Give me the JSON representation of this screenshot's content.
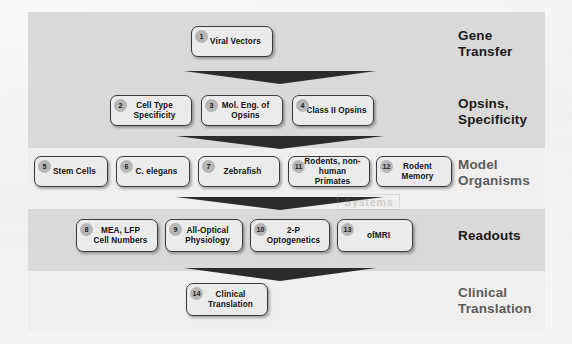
{
  "figure": {
    "watermark": "Systems",
    "colors": {
      "band_shaded": "#d9d9d9",
      "band_light": "#f0efed",
      "node_fill": "#ebebeb",
      "node_border": "#3a3a3a",
      "badge_fill": "#b6b6b6",
      "arrow": "#2b2b2b",
      "page": "#f7f7f5"
    }
  },
  "tiers": [
    {
      "id": "gene-transfer",
      "label": "Gene\nTransfer",
      "shaded": true,
      "muted": false,
      "nodes": [
        {
          "number": "1",
          "label": "Viral Vectors"
        }
      ]
    },
    {
      "id": "opsins-specificity",
      "label": "Opsins,\nSpecificity",
      "shaded": true,
      "muted": false,
      "nodes": [
        {
          "number": "2",
          "label": "Cell Type\nSpecificity"
        },
        {
          "number": "3",
          "label": "Mol. Eng. of\nOpsins"
        },
        {
          "number": "4",
          "label": "Class II Opsins"
        }
      ]
    },
    {
      "id": "model-organisms",
      "label": "Model\nOrganisms",
      "shaded": false,
      "muted": true,
      "nodes": [
        {
          "number": "5",
          "label": "Stem Cells"
        },
        {
          "number": "6",
          "label": "C. elegans"
        },
        {
          "number": "7",
          "label": "Zebrafish"
        },
        {
          "number": "11",
          "label": "Rodents, non-\nhuman Primates"
        },
        {
          "number": "12",
          "label": "Rodent Memory"
        }
      ]
    },
    {
      "id": "readouts",
      "label": "Readouts",
      "shaded": true,
      "muted": false,
      "nodes": [
        {
          "number": "8",
          "label": "MEA, LFP\nCell Numbers"
        },
        {
          "number": "9",
          "label": "All-Optical\nPhysiology"
        },
        {
          "number": "10",
          "label": "2-P Optogenetics"
        },
        {
          "number": "13",
          "label": "ofMRI"
        }
      ]
    },
    {
      "id": "clinical-translation",
      "label": "Clinical\nTranslation",
      "shaded": false,
      "muted": true,
      "nodes": [
        {
          "number": "14",
          "label": "Clinical\nTranslation"
        }
      ]
    }
  ],
  "arrows": [
    {
      "id": "arrow-1",
      "from": "gene-transfer",
      "to": "opsins-specificity"
    },
    {
      "id": "arrow-2",
      "from": "opsins-specificity",
      "to": "model-organisms"
    },
    {
      "id": "arrow-3",
      "from": "model-organisms",
      "to": "readouts"
    },
    {
      "id": "arrow-4",
      "from": "readouts",
      "to": "clinical-translation"
    }
  ]
}
